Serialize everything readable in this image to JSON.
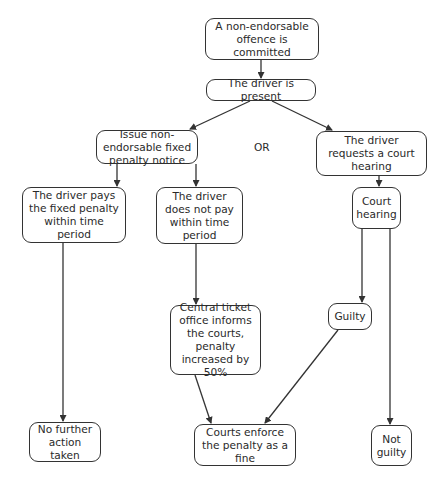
{
  "diagram": {
    "type": "flowchart",
    "nodes": [
      {
        "id": "n1",
        "text": "A non-endorsable offence is committed"
      },
      {
        "id": "n2",
        "text": "The driver is present"
      },
      {
        "id": "n3",
        "text": "Issue non-endorsable fixed penalty notice"
      },
      {
        "id": "n4",
        "text": "The driver requests a court hearing"
      },
      {
        "id": "n5",
        "text": "The driver pays the fixed penalty within time period"
      },
      {
        "id": "n6",
        "text": "The driver does not pay within time period"
      },
      {
        "id": "n7",
        "text": "Court hearing"
      },
      {
        "id": "n8",
        "text": "Central ticket office informs the courts, penalty increased by 50%"
      },
      {
        "id": "n9",
        "text": "Guilty"
      },
      {
        "id": "n10",
        "text": "No further action taken"
      },
      {
        "id": "n11",
        "text": "Courts enforce the penalty as a fine"
      },
      {
        "id": "n12",
        "text": "Not guilty"
      }
    ],
    "or_label": "OR",
    "edges": [
      [
        "n1",
        "n2"
      ],
      [
        "n2",
        "n3"
      ],
      [
        "n2",
        "n4"
      ],
      [
        "n3",
        "n5"
      ],
      [
        "n3",
        "n6"
      ],
      [
        "n4",
        "n7"
      ],
      [
        "n5",
        "n10"
      ],
      [
        "n6",
        "n8"
      ],
      [
        "n7",
        "n9"
      ],
      [
        "n7",
        "n12"
      ],
      [
        "n8",
        "n11"
      ],
      [
        "n9",
        "n11"
      ]
    ],
    "colors": {
      "line": "#333333",
      "background": "#ffffff"
    }
  }
}
